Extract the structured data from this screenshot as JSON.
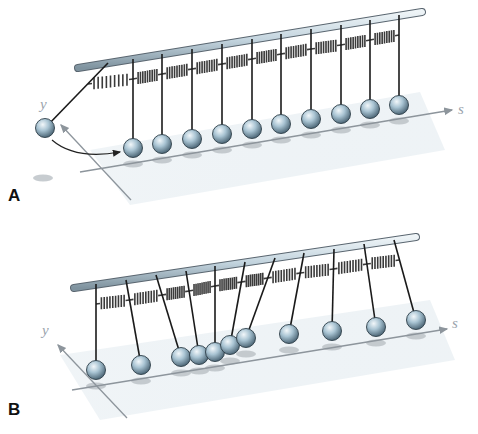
{
  "figure": {
    "colors": {
      "rod_fill": "#c9d9e2",
      "rod_stroke": "#5a6670",
      "ball_light": "#e8f1f6",
      "ball_mid": "#9fbccd",
      "ball_dark": "#4e6878",
      "string": "#1a1a1a",
      "spring": "#3a3a3a",
      "plane": "#e7eef3",
      "shadow": "#b9bfc4",
      "axis": "#8d959c"
    },
    "panels": [
      {
        "label": "A",
        "axis_labels": {
          "y": "y",
          "s": "s"
        },
        "state": "First pendulum displaced along y; others at rest",
        "pendulum_count": 11,
        "rod": {
          "x1": 78,
          "y1": 68,
          "x2": 422,
          "y2": 12
        },
        "pendulums": [
          {
            "top": [
              108,
              63
            ],
            "ball": [
              45,
              128
            ]
          },
          {
            "top": [
              133,
              59
            ],
            "ball": [
              133,
              148
            ]
          },
          {
            "top": [
              162,
              54
            ],
            "ball": [
              162,
              144
            ]
          },
          {
            "top": [
              192,
              49
            ],
            "ball": [
              192,
              139
            ]
          },
          {
            "top": [
              222,
              44
            ],
            "ball": [
              222,
              134
            ]
          },
          {
            "top": [
              252,
              39
            ],
            "ball": [
              252,
              129
            ]
          },
          {
            "top": [
              281,
              34
            ],
            "ball": [
              281,
              124
            ]
          },
          {
            "top": [
              311,
              29
            ],
            "ball": [
              311,
              119
            ]
          },
          {
            "top": [
              341,
              25
            ],
            "ball": [
              341,
              114
            ]
          },
          {
            "top": [
              370,
              20
            ],
            "ball": [
              370,
              109
            ]
          },
          {
            "top": [
              399,
              15
            ],
            "ball": [
              399,
              105
            ]
          }
        ],
        "springs_y_offset": 20
      },
      {
        "label": "B",
        "axis_labels": {
          "y": "y",
          "s": "s"
        },
        "state": "Wave pulse propagating along s; pendulums displaced in compression region",
        "pendulum_count": 11,
        "rod": {
          "x1": 74,
          "y1": 288,
          "x2": 416,
          "y2": 237
        },
        "pendulums": [
          {
            "top": [
              96,
              284
            ],
            "ball": [
              96,
              370
            ]
          },
          {
            "top": [
              126,
              280
            ],
            "ball": [
              141,
              365
            ]
          },
          {
            "top": [
              156,
              275
            ],
            "ball": [
              181,
              357
            ]
          },
          {
            "top": [
              186,
              271
            ],
            "ball": [
              199,
              355
            ]
          },
          {
            "top": [
              215,
              266
            ],
            "ball": [
              215,
              352
            ]
          },
          {
            "top": [
              245,
              262
            ],
            "ball": [
              230,
              345
            ]
          },
          {
            "top": [
              275,
              258
            ],
            "ball": [
              246,
              338
            ]
          },
          {
            "top": [
              304,
              253
            ],
            "ball": [
              289,
              334
            ]
          },
          {
            "top": [
              334,
              249
            ],
            "ball": [
              332,
              331
            ]
          },
          {
            "top": [
              364,
              244
            ],
            "ball": [
              376,
              327
            ]
          },
          {
            "top": [
              394,
              240
            ],
            "ball": [
              416,
              320
            ]
          }
        ],
        "springs_y_offset": 20
      }
    ]
  }
}
